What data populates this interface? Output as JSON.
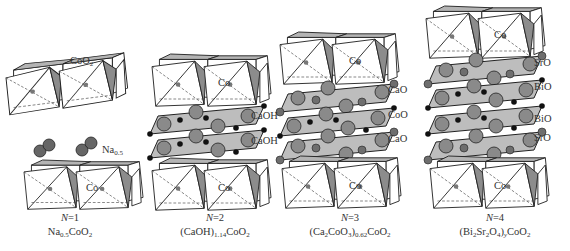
{
  "figure": {
    "panels": [
      {
        "id": "n1",
        "n_label": "N=1",
        "formula": {
          "parts": [
            "Na",
            "0.5",
            "CoO",
            "2"
          ]
        },
        "layer_labels": [
          "CoO2",
          "Na0.5"
        ],
        "co_label": "Co"
      },
      {
        "id": "n2",
        "n_label": "N=2",
        "formula": {
          "parts": [
            "(CaOH)",
            "1.14",
            "CoO",
            "2"
          ]
        },
        "layer_labels": [
          "CaOH",
          "CaOH"
        ],
        "co_label": "Co"
      },
      {
        "id": "n3",
        "n_label": "N=3",
        "formula": {
          "parts": [
            "(Ca",
            "2",
            "CoO",
            "3",
            ")",
            "0.62",
            "CoO",
            "2"
          ]
        },
        "layer_labels": [
          "CaO",
          "CoO",
          "CaO"
        ],
        "co_label": "Co"
      },
      {
        "id": "n4",
        "n_label": "N=4",
        "formula": {
          "parts": [
            "(Bi",
            "2",
            "Sr",
            "2",
            "O",
            "4",
            ")",
            "y",
            "CoO",
            "2"
          ]
        },
        "layer_labels": [
          "SrO",
          "BiO",
          "BiO",
          "SrO"
        ],
        "co_label": "Co"
      }
    ],
    "labels": {
      "n1_coo2": "CoO",
      "n1_coo2_sub": "2",
      "n1_na": "Na",
      "n1_na_sub": "0.5",
      "n2_layer1": "CaOH",
      "n2_layer2": "CaOH",
      "n3_layer1": "CaO",
      "n3_layer2": "CoO",
      "n3_layer3": "CaO",
      "n4_layer1": "SrO",
      "n4_layer2": "BiO",
      "n4_layer3": "BiO",
      "n4_layer4": "SrO",
      "co": "Co"
    },
    "captions": {
      "n1_n": "N",
      "n1_eq": "=1",
      "n1_f1": "Na",
      "n1_s1": "0.5",
      "n1_f2": "CoO",
      "n1_s2": "2",
      "n2_n": "N",
      "n2_eq": "=2",
      "n2_f1": "(CaOH)",
      "n2_s1": "1.14",
      "n2_f2": "CoO",
      "n2_s2": "2",
      "n3_n": "N",
      "n3_eq": "=3",
      "n3_f1": "(Ca",
      "n3_s1": "2",
      "n3_f2": "CoO",
      "n3_s2": "3",
      "n3_f3": ")",
      "n3_s3": "0.62",
      "n3_f4": "CoO",
      "n3_s4": "2",
      "n4_n": "N",
      "n4_eq": "=4",
      "n4_f1": "(Bi",
      "n4_s1": "2",
      "n4_f2": "Sr",
      "n4_s2": "2",
      "n4_f3": "O",
      "n4_s3": "4",
      "n4_f4": ")",
      "n4_s4": "y",
      "n4_f5": "CoO",
      "n4_s5": "2"
    },
    "colors": {
      "octa_face": "#ffffff",
      "octa_side": "#8c8c8c",
      "octa_top": "#b4b4b4",
      "layer_plane": "#bdbdbd",
      "large_atom": "#8a8a8a",
      "small_atom": "#111111",
      "medium_atom": "#6e6e6e"
    }
  }
}
